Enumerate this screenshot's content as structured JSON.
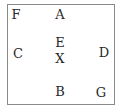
{
  "diagram": {
    "border_color": "#8a8a8a",
    "text_color": "#2a2a2a",
    "labels": [
      {
        "id": "F",
        "text": "F",
        "x": 16,
        "y": 14
      },
      {
        "id": "A",
        "text": "A",
        "x": 60,
        "y": 14
      },
      {
        "id": "E",
        "text": "E",
        "x": 60,
        "y": 42
      },
      {
        "id": "C",
        "text": "C",
        "x": 18,
        "y": 53
      },
      {
        "id": "X",
        "text": "X",
        "x": 60,
        "y": 58
      },
      {
        "id": "D",
        "text": "D",
        "x": 104,
        "y": 52
      },
      {
        "id": "B",
        "text": "B",
        "x": 60,
        "y": 91
      },
      {
        "id": "G",
        "text": "G",
        "x": 101,
        "y": 92
      }
    ]
  }
}
